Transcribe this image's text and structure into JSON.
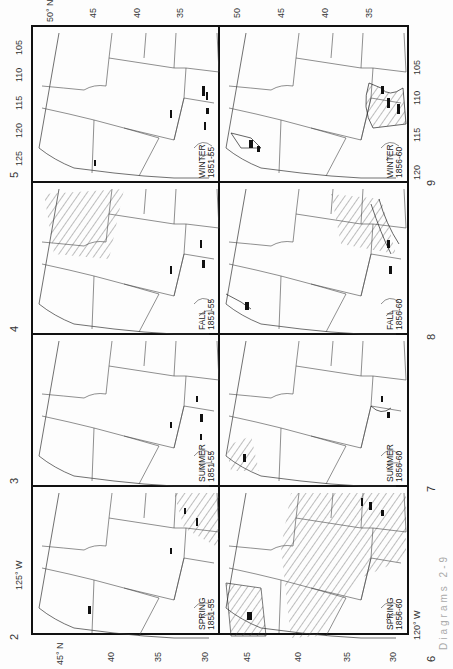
{
  "figure": {
    "panel_numbers": [
      "2",
      "3",
      "4",
      "5",
      "6",
      "7",
      "8",
      "9"
    ],
    "panels": [
      {
        "number": "5",
        "season": "WINTER",
        "period": "1851-55"
      },
      {
        "number": "9",
        "season": "WINTER",
        "period": "1856-60"
      },
      {
        "number": "4",
        "season": "FALL",
        "period": "1851-55"
      },
      {
        "number": "8",
        "season": "FALL",
        "period": "1856-60"
      },
      {
        "number": "3",
        "season": "SUMMER",
        "period": "1851-55"
      },
      {
        "number": "7",
        "season": "SUMMER",
        "period": "1856-60"
      },
      {
        "number": "2",
        "season": "SPRING",
        "period": "1851-55"
      },
      {
        "number": "6",
        "season": "SPRING",
        "period": "1856-60"
      }
    ],
    "lat_ticks_top": [
      "50° N",
      "45",
      "40",
      "35"
    ],
    "lat_ticks_top_right": [
      "50",
      "45",
      "40",
      "35"
    ],
    "lat_ticks_bottom_left": [
      "45° N",
      "40",
      "35",
      "30"
    ],
    "lat_ticks_bottom_right": [
      "45",
      "40",
      "35",
      "30"
    ],
    "lon_ticks_left": [
      "105",
      "110",
      "115",
      "120",
      "125"
    ],
    "lon_ticks_left_bottom": [
      "115",
      "120",
      "125° W"
    ],
    "lon_ticks_right": [
      "105",
      "110",
      "115",
      "120"
    ],
    "lon_ticks_right_bottom": [
      "120° W"
    ],
    "caption_fragment": "Diagrams 2-9"
  }
}
